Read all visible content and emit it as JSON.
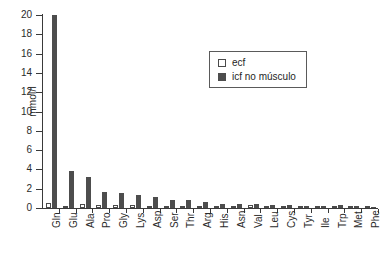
{
  "chart_data": {
    "type": "bar",
    "title": "",
    "xlabel": "",
    "ylabel": "mmol/l",
    "ylim": [
      0,
      20
    ],
    "ytick_step": 2,
    "yticks": [
      "0",
      "2",
      "4",
      "6",
      "8",
      "10",
      "12",
      "14",
      "16",
      "18",
      "20"
    ],
    "grid": false,
    "legend_position": "upper-right-inside",
    "categories": [
      "Gln",
      "Glu",
      "Ala",
      "Pro",
      "Gly",
      "Lys",
      "Asp",
      "Ser",
      "Thr",
      "Arg",
      "His",
      "Asn",
      "Val",
      "Leu",
      "Cys",
      "Tyr",
      "Ile",
      "Trp",
      "Met",
      "Phe"
    ],
    "series": [
      {
        "name": "ecf",
        "color": "#ffffff",
        "edge_color": "#4a4a4a",
        "values": [
          0.55,
          0.12,
          0.42,
          0.3,
          0.28,
          0.3,
          0.18,
          0.18,
          0.22,
          0.2,
          0.16,
          0.16,
          0.35,
          0.2,
          0.14,
          0.12,
          0.12,
          0.1,
          0.1,
          0.1
        ]
      },
      {
        "name": "icf no músculo",
        "color": "#4d4d4d",
        "edge_color": "#4d4d4d",
        "values": [
          20.0,
          3.85,
          3.25,
          1.7,
          1.6,
          1.35,
          1.1,
          0.8,
          0.78,
          0.65,
          0.4,
          0.4,
          0.42,
          0.35,
          0.3,
          0.25,
          0.2,
          0.3,
          0.22,
          0.12
        ]
      }
    ]
  },
  "legend": {
    "items": [
      {
        "label": "ecf",
        "swatch": "open-square"
      },
      {
        "label": "icf no músculo",
        "swatch": "filled-square"
      }
    ]
  },
  "colors": {
    "background": "#ffffff",
    "axis": "#3a3a3a",
    "text": "#2b2b2b",
    "bar_ecf": "#ffffff",
    "bar_icf": "#4d4d4d"
  }
}
